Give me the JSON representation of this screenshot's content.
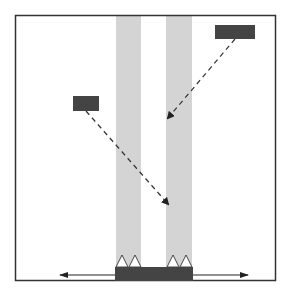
{
  "diagram": {
    "colors": {
      "frame": "#333333",
      "beam": "#d4d4d4",
      "box": "#444444",
      "ray": "#333333",
      "triangle_fill": "#ffffff"
    },
    "frame": {
      "x": 15,
      "y": 15,
      "w": 261,
      "h": 266
    },
    "beams": [
      {
        "x": 116,
        "y": 16,
        "w": 25,
        "h": 250
      },
      {
        "x": 166,
        "y": 16,
        "w": 26,
        "h": 250
      }
    ],
    "sources": [
      {
        "name": "left-source",
        "x": 73,
        "y": 96,
        "w": 26,
        "h": 15
      },
      {
        "name": "right-source",
        "x": 215,
        "y": 25,
        "w": 40,
        "h": 14
      }
    ],
    "rays": [
      {
        "from": [
          86,
          111
        ],
        "to": [
          168,
          204
        ]
      },
      {
        "from": [
          235,
          39
        ],
        "to": [
          168,
          118
        ]
      }
    ],
    "base_block": {
      "x": 115,
      "y": 267,
      "w": 78,
      "h": 14
    },
    "triangles_x": [
      122,
      135,
      173,
      186
    ],
    "axis_arrow": {
      "y": 275,
      "x1": 30,
      "x2": 248
    }
  }
}
